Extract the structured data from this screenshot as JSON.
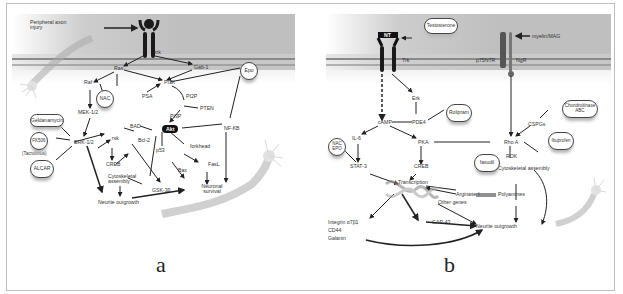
{
  "figure": {
    "panels": [
      {
        "id": "a",
        "caption": "a",
        "labels": {
          "injury": "Peripheral axon injury",
          "trk": "trk",
          "ras": "Ras",
          "gab1": "Gab-1",
          "raf": "Raf",
          "pi3k": "PI3K",
          "psa": "PSA",
          "pi2p": "PI2P",
          "pten": "PTEN",
          "pi3p": "PI3P",
          "mek": "MEK-1/2",
          "erk": "ERK-1/2",
          "rsk": "rsk",
          "creb": "CREB",
          "bad": "BAD",
          "bcl2": "Bcl-2",
          "akt": "Akt",
          "nfkb": "NF-KB",
          "p53": "p53",
          "forkhead": "forkhead",
          "fasl": "FasL",
          "bax": "Bax",
          "gsk3b": "GSK-3β",
          "cytoskeletal": "Cytoskeletal assembly",
          "neurite": "Neurite outgrowth",
          "survival": "Neuronal survival",
          "tacrolimus": "(Tacrolimus)"
        },
        "drugs": {
          "nac": "NAC",
          "epo": "Epo",
          "geldanamycin": "Geldanamycin",
          "fk506": "FK506",
          "alcar": "ALCAR"
        }
      },
      {
        "id": "b",
        "caption": "b",
        "labels": {
          "nt": "NT",
          "trk": "Trk",
          "p75ntr": "p75NTR",
          "ngr": "NgR",
          "myelin": "myelin/MAG",
          "erk": "Erk",
          "pde4": "PDE4",
          "camp": "cAMP",
          "il6": "IL-6",
          "pka": "PKA",
          "stat3": "STAT-3",
          "creb": "CREB",
          "transcription": "Transcription",
          "arginase": "Arginase I",
          "polyamines": "Polyamines",
          "other_genes": "Other genes",
          "gap43": "GAP-43",
          "integrin": "Integrin α7β1",
          "cd44": "CD44",
          "galanin": "Galanin",
          "rhoa": "Rho A",
          "rok": "ROK",
          "cspgs": "CSPGs",
          "cytoskeletal": "Cytoskeletal assembly",
          "neurite": "Neurite outgrowth"
        },
        "drugs": {
          "testosterone": "Testosterone",
          "rolipram": "Rolipram",
          "nac_epo": "NAC EPO",
          "fasudil": "fasudil",
          "ibuprofen": "Ibuprofen",
          "chondroitinase": "Chondroitinase ABC"
        }
      }
    ],
    "colors": {
      "membrane": "#bfbfbf",
      "membrane_line": "#8a8a8a",
      "receptor": "#1a1a1a",
      "arrow": "#222222",
      "frame": "#bdbdbd"
    }
  }
}
